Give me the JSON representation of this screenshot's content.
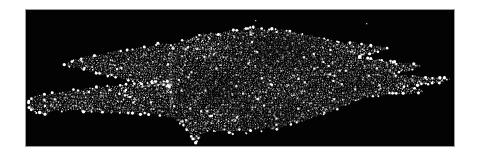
{
  "canvas": {
    "width": 489,
    "height": 166,
    "background": "#ffffff"
  },
  "frame": {
    "x": 25,
    "y": 9,
    "width": 428,
    "height": 136,
    "border_color": "#9a9a9a",
    "background": "#030303"
  },
  "particles": {
    "seed": 42,
    "dot_spacing": 2.0,
    "row_step": 1.75,
    "jitter": 0.65,
    "min_gray": 80,
    "gray_range": 175,
    "big_dot_prob": 0.13,
    "white_speck_prob": 0.012,
    "bright_dot_color": "#ffffff",
    "edge_stud_stride": 4,
    "edge_stud_prob": 0.33,
    "regions": {
      "upper_left_arm": [
        [
          64,
          64
        ],
        [
          74,
          60
        ],
        [
          86,
          57
        ],
        [
          100,
          54
        ],
        [
          116,
          51
        ],
        [
          132,
          49
        ],
        [
          148,
          47
        ],
        [
          158,
          44
        ],
        [
          166,
          44
        ],
        [
          173,
          43
        ],
        [
          173,
          88
        ],
        [
          166,
          86
        ],
        [
          155,
          85
        ],
        [
          140,
          82
        ],
        [
          124,
          79
        ],
        [
          108,
          76
        ],
        [
          92,
          72
        ],
        [
          78,
          68
        ],
        [
          68,
          66
        ]
      ],
      "lower_left_arm": [
        [
          28,
          101
        ],
        [
          36,
          96
        ],
        [
          48,
          94
        ],
        [
          62,
          92
        ],
        [
          80,
          89
        ],
        [
          100,
          87
        ],
        [
          122,
          85
        ],
        [
          144,
          83
        ],
        [
          164,
          81
        ],
        [
          173,
          80
        ],
        [
          173,
          118
        ],
        [
          160,
          115
        ],
        [
          140,
          114
        ],
        [
          118,
          113
        ],
        [
          96,
          112
        ],
        [
          74,
          111
        ],
        [
          56,
          111
        ],
        [
          44,
          114
        ],
        [
          34,
          112
        ],
        [
          29,
          107
        ]
      ],
      "main_body": [
        [
          171,
          46
        ],
        [
          182,
          41
        ],
        [
          192,
          38
        ],
        [
          202,
          34
        ],
        [
          210,
          33
        ],
        [
          218,
          34
        ],
        [
          226,
          31
        ],
        [
          236,
          30
        ],
        [
          246,
          28
        ],
        [
          254,
          27
        ],
        [
          262,
          29
        ],
        [
          272,
          29
        ],
        [
          282,
          30
        ],
        [
          292,
          32
        ],
        [
          302,
          34
        ],
        [
          312,
          36
        ],
        [
          320,
          38
        ],
        [
          330,
          40
        ],
        [
          338,
          42
        ],
        [
          346,
          43
        ],
        [
          354,
          42
        ],
        [
          362,
          44
        ],
        [
          371,
          45
        ],
        [
          380,
          46
        ],
        [
          387,
          48
        ],
        [
          378,
          52
        ],
        [
          368,
          55
        ],
        [
          360,
          57
        ],
        [
          370,
          59
        ],
        [
          382,
          60
        ],
        [
          394,
          62
        ],
        [
          406,
          63
        ],
        [
          415,
          64
        ],
        [
          421,
          66
        ],
        [
          412,
          70
        ],
        [
          402,
          72
        ],
        [
          394,
          74
        ],
        [
          388,
          75
        ],
        [
          400,
          75
        ],
        [
          414,
          76
        ],
        [
          428,
          77
        ],
        [
          440,
          78
        ],
        [
          451,
          79
        ],
        [
          440,
          83
        ],
        [
          426,
          84
        ],
        [
          412,
          85
        ],
        [
          402,
          86
        ],
        [
          410,
          87
        ],
        [
          418,
          88
        ],
        [
          426,
          91
        ],
        [
          417,
          93
        ],
        [
          407,
          94
        ],
        [
          396,
          94
        ],
        [
          386,
          94
        ],
        [
          377,
          96
        ],
        [
          367,
          97
        ],
        [
          355,
          101
        ],
        [
          344,
          106
        ],
        [
          334,
          110
        ],
        [
          324,
          114
        ],
        [
          314,
          118
        ],
        [
          304,
          121
        ],
        [
          294,
          123
        ],
        [
          284,
          126
        ],
        [
          275,
          130
        ],
        [
          268,
          127
        ],
        [
          261,
          131
        ],
        [
          253,
          128
        ],
        [
          246,
          133
        ],
        [
          239,
          130
        ],
        [
          232,
          134
        ],
        [
          225,
          130
        ],
        [
          217,
          132
        ],
        [
          210,
          130
        ],
        [
          204,
          133
        ],
        [
          199,
          138
        ],
        [
          195,
          143
        ],
        [
          191,
          136
        ],
        [
          186,
          129
        ],
        [
          180,
          124
        ],
        [
          175,
          119
        ],
        [
          171,
          114
        ],
        [
          170,
          105
        ],
        [
          169,
          95
        ],
        [
          169,
          80
        ],
        [
          170,
          65
        ],
        [
          171,
          55
        ]
      ]
    },
    "stray_dots": [
      [
        255,
        20
      ],
      [
        366,
        23
      ]
    ]
  }
}
